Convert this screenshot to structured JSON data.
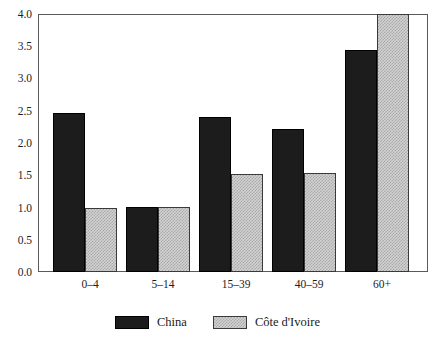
{
  "chart_data": {
    "type": "bar",
    "title": "",
    "subtitle": "",
    "xlabel": "",
    "ylabel": "",
    "categories": [
      "0–4",
      "5–14",
      "15–39",
      "40–59",
      "60+"
    ],
    "series": [
      {
        "name": "China",
        "values": [
          2.46,
          1.01,
          2.41,
          2.21,
          3.44
        ],
        "color": "#1c1c1c",
        "fill": "solid-black"
      },
      {
        "name": "Côte d'Ivoire",
        "values": [
          1.0,
          1.01,
          1.52,
          1.53,
          4.0
        ],
        "color": "#d2d2d2",
        "fill": "light-gray-checker"
      }
    ],
    "ylim": [
      0.0,
      4.0
    ],
    "ytick_values": [
      0.0,
      0.5,
      1.0,
      1.5,
      2.0,
      2.5,
      3.0,
      3.5,
      4.0
    ],
    "ytick_labels": [
      "0.0",
      "0.5",
      "1.0",
      "1.5",
      "2.0",
      "2.5",
      "3.0",
      "3.5",
      "4.0"
    ],
    "grid": false,
    "legend_position": "bottom-center"
  },
  "legend": {
    "items": [
      {
        "label": "China",
        "swatch": "solid-black-swatch"
      },
      {
        "label": "Côte d'Ivoire",
        "swatch": "checkered-gray-swatch"
      }
    ]
  },
  "axis": {
    "y_labels": [
      "4.0",
      "3.5",
      "3.0",
      "2.5",
      "2.0",
      "1.5",
      "1.0",
      "0.5",
      "0.0"
    ],
    "x_labels": [
      "0–4",
      "5–14",
      "15–39",
      "40–59",
      "60+"
    ]
  }
}
